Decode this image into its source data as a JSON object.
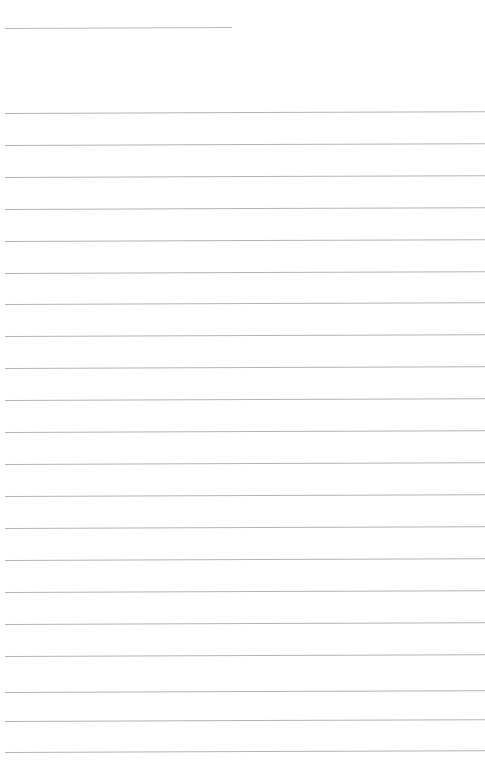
{
  "page": {
    "kind": "blank-lined-paper-scan",
    "width": 485,
    "height": 780,
    "background_color": "#ffffff",
    "has_text": false,
    "text_content": "",
    "visible_labels": []
  },
  "colors": {
    "page_background": "#ffffff",
    "rule_line": "#b4b4b4",
    "rule_line_faint": "#cfcfcf",
    "header_rule_line": "#b9b9b9"
  },
  "header_rule": {
    "name": "header-rule",
    "x": 5,
    "y": 28,
    "width": 227,
    "thickness": 1,
    "slant_deg": -0.25,
    "color": "#b9b9b9"
  },
  "ruled_lines": {
    "count": 21,
    "left_x": 5,
    "right_x": 485,
    "thickness": 1,
    "spacing": 32,
    "slant_deg": -0.22,
    "lines": [
      {
        "index": 1,
        "y": 113,
        "color": "#b4b4b4"
      },
      {
        "index": 2,
        "y": 145,
        "color": "#b4b4b4"
      },
      {
        "index": 3,
        "y": 177,
        "color": "#b4b4b4"
      },
      {
        "index": 4,
        "y": 209,
        "color": "#b4b4b4"
      },
      {
        "index": 5,
        "y": 241,
        "color": "#b4b4b4"
      },
      {
        "index": 6,
        "y": 273,
        "color": "#b4b4b4"
      },
      {
        "index": 7,
        "y": 304,
        "color": "#b4b4b4"
      },
      {
        "index": 8,
        "y": 336,
        "color": "#b4b4b4"
      },
      {
        "index": 9,
        "y": 368,
        "color": "#b4b4b4"
      },
      {
        "index": 10,
        "y": 400,
        "color": "#b4b4b4"
      },
      {
        "index": 11,
        "y": 432,
        "color": "#b4b4b4"
      },
      {
        "index": 12,
        "y": 464,
        "color": "#b4b4b4"
      },
      {
        "index": 13,
        "y": 496,
        "color": "#b4b4b4"
      },
      {
        "index": 14,
        "y": 528,
        "color": "#b4b4b4"
      },
      {
        "index": 15,
        "y": 560,
        "color": "#b4b4b4"
      },
      {
        "index": 16,
        "y": 592,
        "color": "#b4b4b4"
      },
      {
        "index": 17,
        "y": 624,
        "color": "#b4b4b4"
      },
      {
        "index": 18,
        "y": 656,
        "color": "#b4b4b4"
      },
      {
        "index": 19,
        "y": 692,
        "color": "#b4b4b4"
      },
      {
        "index": 20,
        "y": 721,
        "color": "#b4b4b4"
      },
      {
        "index": 21,
        "y": 752,
        "color": "#b4b4b4"
      }
    ]
  }
}
